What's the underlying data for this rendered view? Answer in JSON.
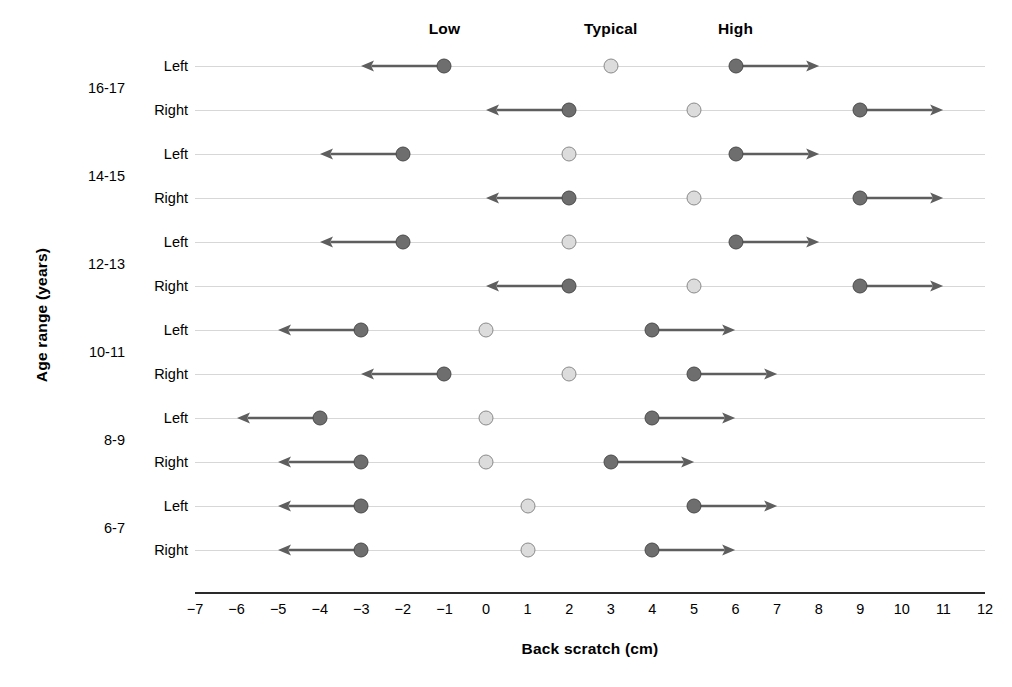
{
  "chart_data": {
    "type": "scatter",
    "title": "",
    "xlabel": "Back scratch (cm)",
    "ylabel": "Age range (years)",
    "xlim": [
      -7,
      12
    ],
    "xticks": [
      -7,
      -6,
      -5,
      -4,
      -3,
      -2,
      -1,
      0,
      1,
      2,
      3,
      4,
      5,
      6,
      7,
      8,
      9,
      10,
      11,
      12
    ],
    "xticklabels": [
      "−7",
      "−6",
      "−5",
      "−4",
      "−3",
      "−2",
      "−1",
      "0",
      "1",
      "2",
      "3",
      "4",
      "5",
      "6",
      "7",
      "8",
      "9",
      "10",
      "11",
      "12"
    ],
    "grid": "horizontal-row-lines",
    "legend_position": "top",
    "column_headers": [
      {
        "label": "Low",
        "value": -1
      },
      {
        "label": "Typical",
        "value": 3
      },
      {
        "label": "High",
        "value": 6
      }
    ],
    "series": [
      {
        "name": "Low",
        "marker": "dark-circle",
        "arrow": "left",
        "color": "#6e6e6e"
      },
      {
        "name": "Typical",
        "marker": "light-circle",
        "arrow": "none",
        "color": "#dcdcdc"
      },
      {
        "name": "High",
        "marker": "dark-circle",
        "arrow": "right",
        "color": "#6e6e6e"
      }
    ],
    "age_groups": [
      {
        "label": "16-17",
        "rows": [
          0,
          1
        ]
      },
      {
        "label": "14-15",
        "rows": [
          2,
          3
        ]
      },
      {
        "label": "12-13",
        "rows": [
          4,
          5
        ]
      },
      {
        "label": "10-11",
        "rows": [
          6,
          7
        ]
      },
      {
        "label": "8-9",
        "rows": [
          8,
          9
        ]
      },
      {
        "label": "6-7",
        "rows": [
          10,
          11
        ]
      }
    ],
    "rows": [
      {
        "side": "Left",
        "age": "16-17",
        "low": -1,
        "typical": 3,
        "high": 6
      },
      {
        "side": "Right",
        "age": "16-17",
        "low": 2,
        "typical": 5,
        "high": 9
      },
      {
        "side": "Left",
        "age": "14-15",
        "low": -2,
        "typical": 2,
        "high": 6
      },
      {
        "side": "Right",
        "age": "14-15",
        "low": 2,
        "typical": 5,
        "high": 9
      },
      {
        "side": "Left",
        "age": "12-13",
        "low": -2,
        "typical": 2,
        "high": 6
      },
      {
        "side": "Right",
        "age": "12-13",
        "low": 2,
        "typical": 5,
        "high": 9
      },
      {
        "side": "Left",
        "age": "10-11",
        "low": -3,
        "typical": 0,
        "high": 4
      },
      {
        "side": "Right",
        "age": "10-11",
        "low": -1,
        "typical": 2,
        "high": 5
      },
      {
        "side": "Left",
        "age": "8-9",
        "low": -4,
        "typical": 0,
        "high": 4
      },
      {
        "side": "Right",
        "age": "8-9",
        "low": -3,
        "typical": 0,
        "high": 3
      },
      {
        "side": "Left",
        "age": "6-7",
        "low": -3,
        "typical": 1,
        "high": 5
      },
      {
        "side": "Right",
        "age": "6-7",
        "low": -3,
        "typical": 1,
        "high": 4
      }
    ],
    "arrow_extent": 2
  }
}
